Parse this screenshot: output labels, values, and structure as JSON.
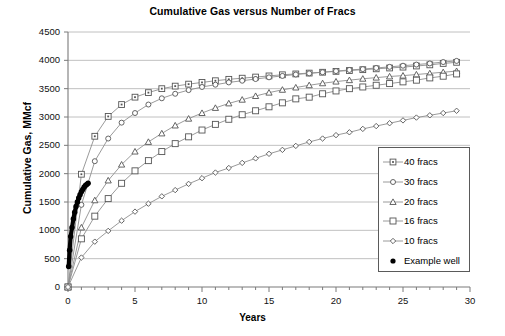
{
  "chart_data": {
    "type": "line",
    "title": "Cumulative Gas versus Number of Fracs",
    "xlabel": "Years",
    "ylabel": "Cumulative Gas, MMcf",
    "xlim": [
      0,
      30
    ],
    "ylim": [
      0,
      4500
    ],
    "xticks": [
      0,
      5,
      10,
      15,
      20,
      25,
      30
    ],
    "yticks": [
      0,
      500,
      1000,
      1500,
      2000,
      2500,
      3000,
      3500,
      4000,
      4500
    ],
    "xtick_labels": [
      "0",
      "5",
      "10",
      "15",
      "20",
      "25",
      "30"
    ],
    "ytick_labels": [
      "0",
      "500",
      "1000",
      "1500",
      "2000",
      "2500",
      "3000",
      "3500",
      "4000",
      "4500"
    ],
    "x_minor_tick_interval": 1,
    "grid": "horizontal",
    "legend_position": "center-right",
    "series": [
      {
        "name": "40 fracs",
        "marker": "square-dot",
        "color": "#808080",
        "x": [
          0,
          1,
          2,
          3,
          4,
          5,
          6,
          7,
          8,
          9,
          10,
          11,
          12,
          13,
          14,
          15,
          16,
          17,
          18,
          19,
          20,
          21,
          22,
          23,
          24,
          25,
          26,
          27,
          28,
          29
        ],
        "values": [
          0,
          1990,
          2660,
          3010,
          3220,
          3350,
          3430,
          3500,
          3545,
          3580,
          3610,
          3640,
          3665,
          3685,
          3705,
          3725,
          3745,
          3760,
          3775,
          3790,
          3805,
          3820,
          3835,
          3850,
          3865,
          3880,
          3900,
          3920,
          3945,
          3965
        ]
      },
      {
        "name": "30 fracs",
        "marker": "circle",
        "color": "#808080",
        "x": [
          0,
          1,
          2,
          3,
          4,
          5,
          6,
          7,
          8,
          9,
          10,
          11,
          12,
          13,
          14,
          15,
          16,
          17,
          18,
          19,
          20,
          21,
          22,
          23,
          24,
          25,
          26,
          27,
          28,
          29
        ],
        "values": [
          0,
          1450,
          2220,
          2620,
          2900,
          3070,
          3220,
          3330,
          3410,
          3475,
          3530,
          3570,
          3610,
          3640,
          3670,
          3700,
          3725,
          3750,
          3770,
          3790,
          3810,
          3830,
          3845,
          3865,
          3885,
          3905,
          3925,
          3945,
          3970,
          3990
        ]
      },
      {
        "name": "20 fracs",
        "marker": "triangle",
        "color": "#808080",
        "x": [
          0,
          1,
          2,
          3,
          4,
          5,
          6,
          7,
          8,
          9,
          10,
          11,
          12,
          13,
          14,
          15,
          16,
          17,
          18,
          19,
          20,
          21,
          22,
          23,
          24,
          25,
          26,
          27,
          28,
          29
        ],
        "values": [
          0,
          1050,
          1530,
          1880,
          2160,
          2390,
          2560,
          2710,
          2850,
          2970,
          3070,
          3160,
          3240,
          3305,
          3370,
          3430,
          3480,
          3520,
          3560,
          3595,
          3625,
          3650,
          3675,
          3695,
          3715,
          3730,
          3750,
          3770,
          3790,
          3810
        ]
      },
      {
        "name": "16 fracs",
        "marker": "square",
        "color": "#808080",
        "x": [
          0,
          1,
          2,
          3,
          4,
          5,
          6,
          7,
          8,
          9,
          10,
          11,
          12,
          13,
          14,
          15,
          16,
          17,
          18,
          19,
          20,
          21,
          22,
          23,
          24,
          25,
          26,
          27,
          28,
          29
        ],
        "values": [
          0,
          850,
          1250,
          1560,
          1830,
          2050,
          2230,
          2390,
          2530,
          2650,
          2770,
          2870,
          2960,
          3040,
          3110,
          3180,
          3250,
          3320,
          3350,
          3410,
          3460,
          3500,
          3530,
          3560,
          3590,
          3620,
          3650,
          3690,
          3720,
          3760
        ]
      },
      {
        "name": "10 fracs",
        "marker": "diamond",
        "color": "#808080",
        "x": [
          0,
          1,
          2,
          3,
          4,
          5,
          6,
          7,
          8,
          9,
          10,
          11,
          12,
          13,
          14,
          15,
          16,
          17,
          18,
          19,
          20,
          21,
          22,
          23,
          24,
          25,
          26,
          27,
          28,
          29
        ],
        "values": [
          0,
          520,
          800,
          990,
          1170,
          1330,
          1470,
          1600,
          1710,
          1820,
          1920,
          2020,
          2100,
          2190,
          2270,
          2350,
          2420,
          2490,
          2560,
          2620,
          2680,
          2730,
          2790,
          2840,
          2890,
          2940,
          2990,
          3030,
          3070,
          3110
        ]
      },
      {
        "name": "Example well",
        "marker": "filled-circle",
        "color": "#000000",
        "x": [
          0.05,
          0.12,
          0.2,
          0.3,
          0.4,
          0.5,
          0.6,
          0.7,
          0.8,
          0.9,
          1.0,
          1.1,
          1.2,
          1.3,
          1.4,
          1.5
        ],
        "values": [
          360,
          650,
          890,
          1050,
          1200,
          1320,
          1420,
          1500,
          1570,
          1630,
          1680,
          1720,
          1760,
          1790,
          1810,
          1830
        ]
      }
    ]
  },
  "legend": {
    "items": [
      {
        "label": "40 fracs",
        "marker": "square-dot"
      },
      {
        "label": "30 fracs",
        "marker": "circle"
      },
      {
        "label": "20 fracs",
        "marker": "triangle"
      },
      {
        "label": "16 fracs",
        "marker": "square"
      },
      {
        "label": "10 fracs",
        "marker": "diamond"
      },
      {
        "label": "Example well",
        "marker": "filled-circle"
      }
    ]
  },
  "footer": {
    "artifact_text": ""
  }
}
